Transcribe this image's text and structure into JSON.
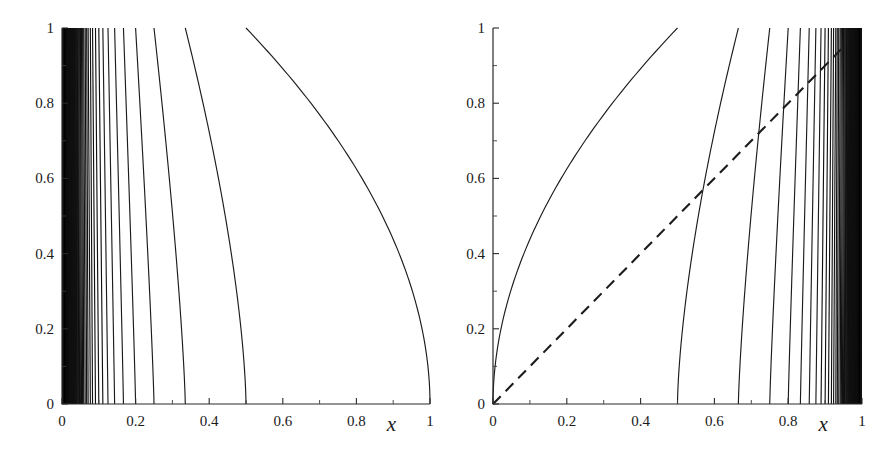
{
  "figure": {
    "background": "#ffffff",
    "ink_color": "#1c1c1c",
    "width": 887,
    "height": 469
  },
  "panels": [
    {
      "id": "left",
      "name": "left-panel",
      "xlabel": "x",
      "ylabel": "",
      "xticks": [
        "0",
        "0.2",
        "0.4",
        "0.6",
        "0.8",
        "1"
      ],
      "xtick_values": [
        0,
        0.2,
        0.4,
        0.6,
        0.8,
        1
      ],
      "yticks": [
        "0",
        "0.2",
        "0.4",
        "0.6",
        "0.8",
        "1"
      ],
      "ytick_values": [
        0,
        0.2,
        0.4,
        0.6,
        0.8,
        1
      ],
      "xlim": [
        0,
        1
      ],
      "ylim": [
        0,
        1
      ],
      "has_dashed_diagonal": false,
      "accumulation_side": "left",
      "description": "Family of curves descending left-to-right, each meeting y=1 slightly left of its y=0 foot; roots accumulate geometrically at x=0 forming a solid black band."
    },
    {
      "id": "right",
      "name": "right-panel",
      "xlabel": "x",
      "ylabel": "",
      "xticks": [
        "0",
        "0.2",
        "0.4",
        "0.6",
        "0.8",
        "1"
      ],
      "xtick_values": [
        0,
        0.2,
        0.4,
        0.6,
        0.8,
        1
      ],
      "yticks": [
        "0",
        "0.2",
        "0.4",
        "0.6",
        "0.8",
        "1"
      ],
      "ytick_values": [
        0,
        0.2,
        0.4,
        0.6,
        0.8,
        1
      ],
      "xlim": [
        0,
        1
      ],
      "ylim": [
        0,
        1
      ],
      "has_dashed_diagonal": true,
      "accumulation_side": "right",
      "description": "Mirror family of curves rising left-to-right; feet accumulate geometrically at x=1 forming a solid black band. A dashed straight line runs from the origin up to about (0.95, 0.95)."
    }
  ],
  "chart_data": {
    "type": "line",
    "title": "",
    "xlabel": "x",
    "ylabel": "",
    "xlim": [
      0,
      1
    ],
    "ylim": [
      0,
      1
    ],
    "grid": false,
    "legend": "none",
    "panels": [
      {
        "name": "left-panel",
        "series": [
          {
            "name": "curve-1",
            "foot_x": 1.0,
            "top_x": 0.5
          },
          {
            "name": "curve-2",
            "foot_x": 0.5,
            "top_x": 0.335
          },
          {
            "name": "curve-3",
            "foot_x": 0.335,
            "top_x": 0.25
          },
          {
            "name": "curve-4",
            "foot_x": 0.25,
            "top_x": 0.2
          },
          {
            "name": "curve-5",
            "foot_x": 0.2,
            "top_x": 0.167
          },
          {
            "name": "curve-6",
            "foot_x": 0.167,
            "top_x": 0.143
          },
          {
            "name": "curve-7",
            "foot_x": 0.143,
            "top_x": 0.125
          },
          {
            "name": "curve-8",
            "foot_x": 0.125,
            "top_x": 0.111
          },
          {
            "name": "curve-9",
            "foot_x": 0.111,
            "top_x": 0.1
          },
          {
            "name": "curve-10",
            "foot_x": 0.1,
            "top_x": 0.091
          },
          {
            "name": "curve-11",
            "foot_x": 0.091,
            "top_x": 0.083
          },
          {
            "name": "curve-12",
            "foot_x": 0.083,
            "top_x": 0.077
          },
          {
            "name": "curve-13",
            "foot_x": 0.077,
            "top_x": 0.071
          },
          {
            "name": "curve-14",
            "foot_x": 0.071,
            "top_x": 0.067
          },
          {
            "name": "curve-15",
            "foot_x": 0.067,
            "top_x": 0.063
          },
          {
            "name": "curve-16",
            "foot_x": 0.063,
            "top_x": 0.059
          },
          {
            "name": "curve-17",
            "foot_x": 0.059,
            "top_x": 0.056
          },
          {
            "name": "curve-18",
            "foot_x": 0.056,
            "top_x": 0.053
          },
          {
            "name": "curve-19",
            "foot_x": 0.053,
            "top_x": 0.05
          },
          {
            "name": "curve-20",
            "foot_x": 0.05,
            "top_x": 0.048
          }
        ],
        "accumulation_point": 0.0
      },
      {
        "name": "right-panel",
        "series": [
          {
            "name": "curve-1",
            "foot_x": 0.0,
            "top_x": 0.5
          },
          {
            "name": "curve-2",
            "foot_x": 0.5,
            "top_x": 0.665
          },
          {
            "name": "curve-3",
            "foot_x": 0.665,
            "top_x": 0.75
          },
          {
            "name": "curve-4",
            "foot_x": 0.75,
            "top_x": 0.8
          },
          {
            "name": "curve-5",
            "foot_x": 0.8,
            "top_x": 0.833
          },
          {
            "name": "curve-6",
            "foot_x": 0.833,
            "top_x": 0.857
          },
          {
            "name": "curve-7",
            "foot_x": 0.857,
            "top_x": 0.875
          },
          {
            "name": "curve-8",
            "foot_x": 0.875,
            "top_x": 0.889
          },
          {
            "name": "curve-9",
            "foot_x": 0.889,
            "top_x": 0.9
          },
          {
            "name": "curve-10",
            "foot_x": 0.9,
            "top_x": 0.909
          },
          {
            "name": "curve-11",
            "foot_x": 0.909,
            "top_x": 0.917
          },
          {
            "name": "curve-12",
            "foot_x": 0.917,
            "top_x": 0.923
          },
          {
            "name": "curve-13",
            "foot_x": 0.923,
            "top_x": 0.929
          },
          {
            "name": "curve-14",
            "foot_x": 0.929,
            "top_x": 0.933
          },
          {
            "name": "curve-15",
            "foot_x": 0.933,
            "top_x": 0.937
          },
          {
            "name": "curve-16",
            "foot_x": 0.937,
            "top_x": 0.941
          },
          {
            "name": "curve-17",
            "foot_x": 0.941,
            "top_x": 0.944
          },
          {
            "name": "curve-18",
            "foot_x": 0.944,
            "top_x": 0.947
          },
          {
            "name": "curve-19",
            "foot_x": 0.947,
            "top_x": 0.95
          },
          {
            "name": "curve-20",
            "foot_x": 0.95,
            "top_x": 0.952
          }
        ],
        "accumulation_point": 1.0,
        "dashed_line": {
          "x0": 0.0,
          "y0": 0.0,
          "x1": 0.95,
          "y1": 0.95
        }
      }
    ]
  }
}
